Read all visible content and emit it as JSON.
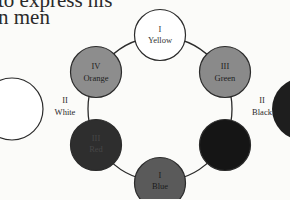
{
  "text": {
    "line1": "to express his",
    "line2": "n men"
  },
  "diagram": {
    "nodes": [
      {
        "id": "yellow",
        "numeral": "I",
        "name": "Yellow",
        "fill": "#ffffff",
        "text": "#333333"
      },
      {
        "id": "green",
        "numeral": "III",
        "name": "Green",
        "fill": "#8a8a8a",
        "text": "#1e1e1e"
      },
      {
        "id": "black-node",
        "numeral": "",
        "name": "",
        "fill": "#151515",
        "text": "#333333"
      },
      {
        "id": "blue",
        "numeral": "I",
        "name": "Blue",
        "fill": "#5a5a5a",
        "text": "#1a1a1a"
      },
      {
        "id": "red",
        "numeral": "III",
        "name": "Red",
        "fill": "#2e2e2e",
        "text": "#3a3a3a"
      },
      {
        "id": "orange",
        "numeral": "IV",
        "name": "Orange",
        "fill": "#8d8d8d",
        "text": "#1e1e1e"
      }
    ],
    "side_labels": {
      "left": {
        "numeral": "II",
        "name": "White"
      },
      "right": {
        "numeral": "II",
        "name": "Black"
      }
    },
    "outer": {
      "left_fill": "#ffffff",
      "right_fill": "#1e1e1e"
    }
  }
}
